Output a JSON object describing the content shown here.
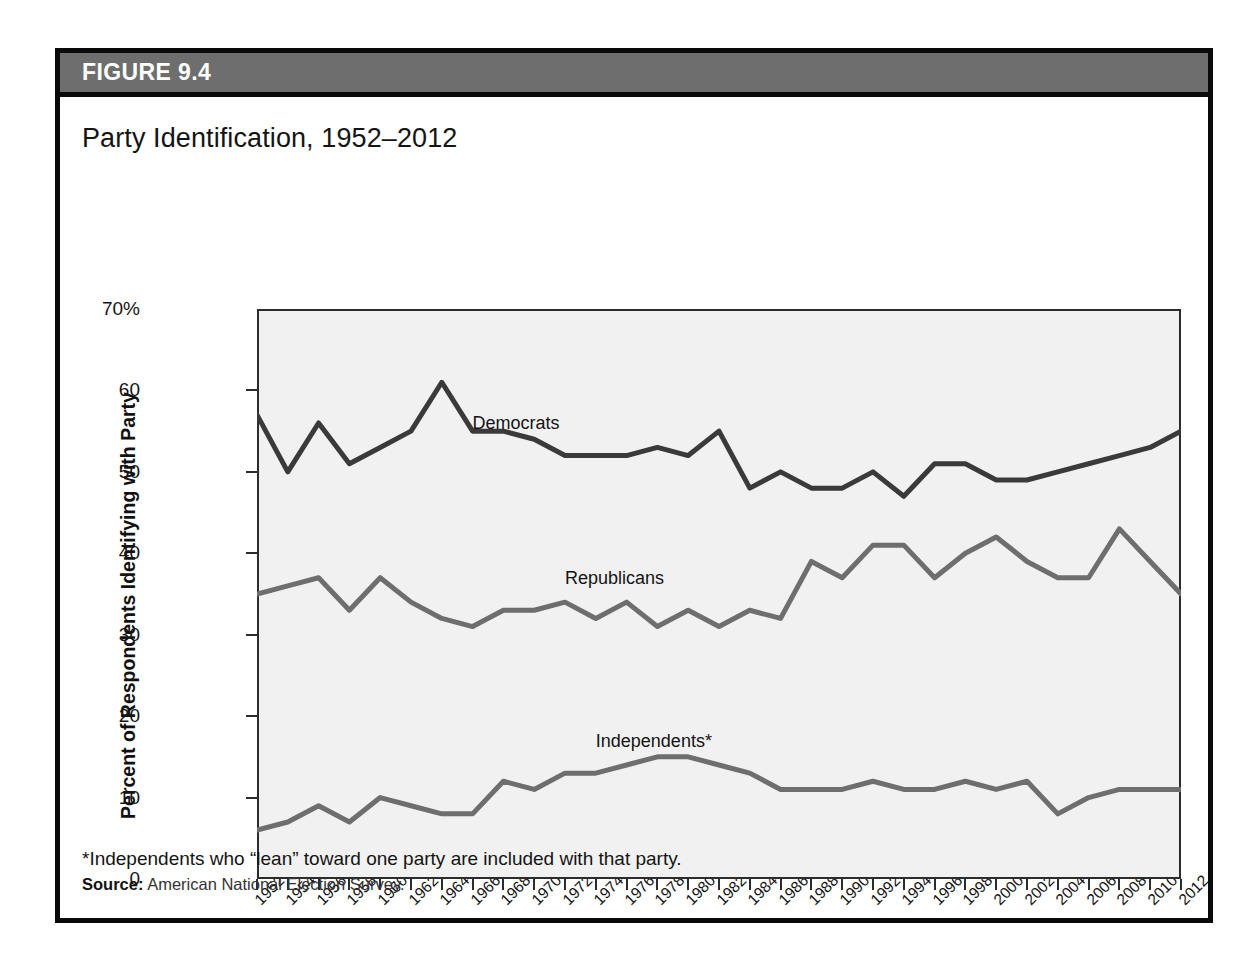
{
  "figure": {
    "number": "FIGURE 9.4",
    "title": "Party Identification, 1952–2012",
    "footnote": "*Independents who “lean” toward one party are included with that party.",
    "source_label": "Source:",
    "source_text": "American National Election Survey."
  },
  "colors": {
    "header_bar": "#6e6e6e",
    "frame": "#0a0a0a",
    "plot_background": "#f1f1f1",
    "democrats": "#3a3a3a",
    "republicans": "#6e6e6e",
    "independents": "#6e6e6e"
  },
  "chart_data": {
    "type": "line",
    "title": "Party Identification, 1952–2012",
    "xlabel": "Year",
    "ylabel": "Percent of Respondents Identifying with Party",
    "ylim": [
      0,
      70
    ],
    "yticks": [
      0,
      10,
      20,
      30,
      40,
      50,
      60,
      70
    ],
    "ytick_labels": [
      "0",
      "10",
      "20",
      "30",
      "40",
      "50",
      "60",
      "70%"
    ],
    "grid": false,
    "legend": "inline-labels",
    "x": [
      1952,
      1954,
      1956,
      1958,
      1960,
      1962,
      1964,
      1966,
      1968,
      1970,
      1972,
      1974,
      1976,
      1978,
      1980,
      1982,
      1984,
      1986,
      1988,
      1990,
      1992,
      1994,
      1996,
      1998,
      2000,
      2002,
      2004,
      2006,
      2008,
      2010,
      2012
    ],
    "categories": [
      "1952",
      "1954",
      "1956",
      "1958",
      "1960",
      "1962",
      "1964",
      "1966",
      "1968",
      "1970",
      "1972",
      "1974",
      "1976",
      "1978",
      "1980",
      "1982",
      "1984",
      "1986",
      "1988",
      "1990",
      "1992",
      "1994",
      "1996",
      "1998",
      "2000",
      "2002",
      "2004",
      "2006",
      "2008",
      "2010",
      "2012"
    ],
    "series": [
      {
        "name": "Democrats",
        "color": "#3a3a3a",
        "label_x": 1966,
        "label_y": 56,
        "values": [
          57,
          50,
          56,
          51,
          53,
          55,
          61,
          55,
          55,
          54,
          52,
          52,
          52,
          53,
          52,
          55,
          48,
          50,
          48,
          48,
          50,
          47,
          51,
          51,
          49,
          49,
          50,
          51,
          52,
          53,
          55
        ]
      },
      {
        "name": "Republicans",
        "color": "#6e6e6e",
        "label_x": 1972,
        "label_y": 37,
        "values": [
          35,
          36,
          37,
          33,
          37,
          34,
          32,
          31,
          33,
          33,
          34,
          32,
          34,
          31,
          33,
          31,
          33,
          32,
          39,
          37,
          41,
          41,
          37,
          40,
          42,
          39,
          37,
          37,
          43,
          39,
          35
        ]
      },
      {
        "name": "Independents*",
        "color": "#6e6e6e",
        "label_x": 1974,
        "label_y": 17,
        "values": [
          6,
          7,
          9,
          7,
          10,
          9,
          8,
          8,
          12,
          11,
          13,
          13,
          14,
          15,
          15,
          14,
          13,
          11,
          11,
          11,
          12,
          11,
          11,
          12,
          11,
          12,
          8,
          10,
          11,
          11,
          11
        ]
      }
    ]
  }
}
